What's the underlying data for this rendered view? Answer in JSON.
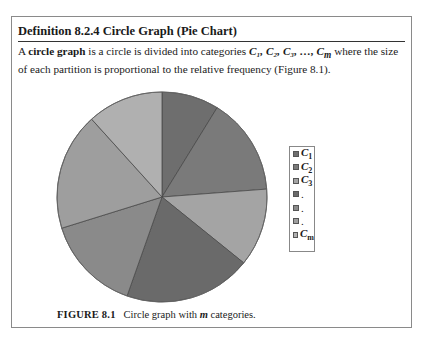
{
  "definition": {
    "title": "Definition 8.2.4  Circle Graph (Pie Chart)",
    "text_before_bold": "A ",
    "bold_term": "circle graph",
    "text_mid": " is a circle is divided into categories ",
    "categories_text": "C₁, C₂, C₃, …, C",
    "categories_sub_m": "m",
    "text_after": " where the size of each partition is proportional to the relative frequency (Figure 8.1)."
  },
  "figure": {
    "label": "FIGURE 8.1",
    "caption_before": "Circle graph with ",
    "caption_var": "m",
    "caption_after": " categories."
  },
  "legend": {
    "items": [
      {
        "label": "C",
        "sub": "1",
        "color": "#6e6e6e"
      },
      {
        "label": "C",
        "sub": "2",
        "color": "#7a7a7a"
      },
      {
        "label": "C",
        "sub": "3",
        "color": "#a4a4a4"
      },
      {
        "label": ".",
        "sub": "",
        "color": "#6a6a6a"
      },
      {
        "label": ".",
        "sub": "",
        "color": "#8a8a8a"
      },
      {
        "label": ".",
        "sub": "",
        "color": "#9e9e9e"
      },
      {
        "label": "C",
        "sub": "m",
        "color": "#b0b0b0"
      }
    ]
  },
  "chart_data": {
    "type": "pie",
    "title": "Circle graph with m categories",
    "categories": [
      "C1",
      "C2",
      "C3",
      ".",
      ".",
      ".",
      "Cm"
    ],
    "values": [
      8.8,
      15.0,
      12.0,
      19.6,
      14.8,
      18.1,
      11.7
    ],
    "start_angle_deg": 0,
    "direction": "clockwise",
    "colors": [
      "#6e6e6e",
      "#7a7a7a",
      "#a4a4a4",
      "#6a6a6a",
      "#8a8a8a",
      "#9e9e9e",
      "#b0b0b0"
    ],
    "legend_position": "right",
    "xlabel": "",
    "ylabel": ""
  }
}
